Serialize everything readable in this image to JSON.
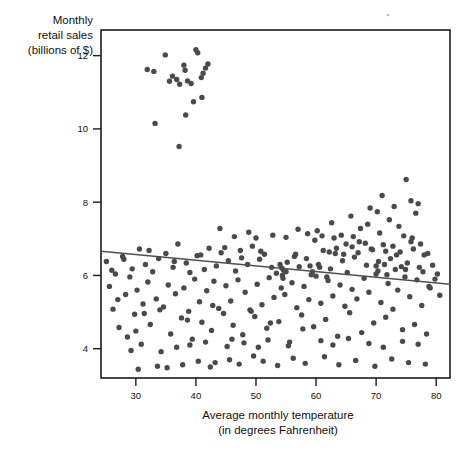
{
  "chart_data": {
    "type": "scatter",
    "title": "",
    "ylabel": "Monthly retail sales (billions of $)",
    "ylabel_line1": "Monthly",
    "ylabel_line2": "retail sales",
    "ylabel_line3": "(billions of $)",
    "xlabel": "Average monthly temperature (in degrees Fahrenheit)",
    "xlabel_line1": "Average monthly temperature",
    "xlabel_line2": "(in degrees Fahrenheit)",
    "xlim": [
      24.2,
      82.3
    ],
    "ylim": [
      3.2,
      12.7
    ],
    "xticks": [
      30,
      40,
      50,
      60,
      70,
      80
    ],
    "yticks": [
      4,
      6,
      8,
      10,
      12
    ],
    "xtick_labels": [
      "30",
      "40",
      "50",
      "60",
      "70",
      "80"
    ],
    "ytick_labels": [
      "4",
      "6",
      "8",
      "10",
      "12"
    ],
    "grid": false,
    "legend": false,
    "legend_position": "none",
    "marker_color": "#4a4a4a",
    "marker_size_px": 5.4,
    "trendline": {
      "type": "linear-regression",
      "color": "#4f4f4f",
      "x_start": 24.2,
      "y_start": 6.66,
      "x_end": 82.3,
      "y_end": 5.76,
      "slope": -0.0155,
      "intercept": 7.035
    },
    "points": [
      [
        29.2,
        3.95
      ],
      [
        31.9,
        11.62
      ],
      [
        33.0,
        11.57
      ],
      [
        34.9,
        12.02
      ],
      [
        35.6,
        11.3
      ],
      [
        36.1,
        11.44
      ],
      [
        36.8,
        11.35
      ],
      [
        37.3,
        11.22
      ],
      [
        38.0,
        11.74
      ],
      [
        38.2,
        11.6
      ],
      [
        38.6,
        11.31
      ],
      [
        39.2,
        11.24
      ],
      [
        40.0,
        12.16
      ],
      [
        40.3,
        12.08
      ],
      [
        40.9,
        11.4
      ],
      [
        41.2,
        11.52
      ],
      [
        41.6,
        11.66
      ],
      [
        42.0,
        11.77
      ],
      [
        39.6,
        10.74
      ],
      [
        41.0,
        10.86
      ],
      [
        33.2,
        10.15
      ],
      [
        38.3,
        10.38
      ],
      [
        37.2,
        9.52
      ],
      [
        25.1,
        6.38
      ],
      [
        25.6,
        5.7
      ],
      [
        26.2,
        5.08
      ],
      [
        26.6,
        6.04
      ],
      [
        27.2,
        4.58
      ],
      [
        27.8,
        6.52
      ],
      [
        28.3,
        5.48
      ],
      [
        28.6,
        4.32
      ],
      [
        29.0,
        5.96
      ],
      [
        29.4,
        6.18
      ],
      [
        29.8,
        4.94
      ],
      [
        30.2,
        5.6
      ],
      [
        30.6,
        6.72
      ],
      [
        30.9,
        4.12
      ],
      [
        31.2,
        5.22
      ],
      [
        31.6,
        6.3
      ],
      [
        32.0,
        5.82
      ],
      [
        32.4,
        4.66
      ],
      [
        32.8,
        6.1
      ],
      [
        33.4,
        5.36
      ],
      [
        33.8,
        6.46
      ],
      [
        34.2,
        3.92
      ],
      [
        34.6,
        5.14
      ],
      [
        35.0,
        6.6
      ],
      [
        35.4,
        5.74
      ],
      [
        35.8,
        4.4
      ],
      [
        36.2,
        6.22
      ],
      [
        36.6,
        5.5
      ],
      [
        37.0,
        6.86
      ],
      [
        37.6,
        4.84
      ],
      [
        38.0,
        5.66
      ],
      [
        38.4,
        6.34
      ],
      [
        38.8,
        5.02
      ],
      [
        39.0,
        6.08
      ],
      [
        39.4,
        4.26
      ],
      [
        39.8,
        5.9
      ],
      [
        40.2,
        6.54
      ],
      [
        40.6,
        5.28
      ],
      [
        41.0,
        4.72
      ],
      [
        41.4,
        6.16
      ],
      [
        41.8,
        5.58
      ],
      [
        42.2,
        6.74
      ],
      [
        42.6,
        4.5
      ],
      [
        43.0,
        5.84
      ],
      [
        43.4,
        6.26
      ],
      [
        43.8,
        5.1
      ],
      [
        44.2,
        6.62
      ],
      [
        44.6,
        4.96
      ],
      [
        45.0,
        5.72
      ],
      [
        45.4,
        6.4
      ],
      [
        45.8,
        5.3
      ],
      [
        46.2,
        4.64
      ],
      [
        46.6,
        6.12
      ],
      [
        47.0,
        5.88
      ],
      [
        47.4,
        6.68
      ],
      [
        47.8,
        4.38
      ],
      [
        48.2,
        5.54
      ],
      [
        48.6,
        6.3
      ],
      [
        49.0,
        5.06
      ],
      [
        49.4,
        6.8
      ],
      [
        49.8,
        4.88
      ],
      [
        50.2,
        5.76
      ],
      [
        50.6,
        6.44
      ],
      [
        51.0,
        5.2
      ],
      [
        51.4,
        6.58
      ],
      [
        51.8,
        4.56
      ],
      [
        52.2,
        5.94
      ],
      [
        52.6,
        6.22
      ],
      [
        53.0,
        5.4
      ],
      [
        53.4,
        6.06
      ],
      [
        53.8,
        4.74
      ],
      [
        54.2,
        5.66
      ],
      [
        54.4,
        6.0
      ],
      [
        54.6,
        6.14
      ],
      [
        54.8,
        5.48
      ],
      [
        55.2,
        6.36
      ],
      [
        55.6,
        4.18
      ],
      [
        56.0,
        5.8
      ],
      [
        56.4,
        6.52
      ],
      [
        56.8,
        5.12
      ],
      [
        57.2,
        6.24
      ],
      [
        57.6,
        4.92
      ],
      [
        58.0,
        5.7
      ],
      [
        58.4,
        6.46
      ],
      [
        58.8,
        5.34
      ],
      [
        59.2,
        6.02
      ],
      [
        59.6,
        4.6
      ],
      [
        60.0,
        5.98
      ],
      [
        60.4,
        6.3
      ],
      [
        60.8,
        5.24
      ],
      [
        61.2,
        6.68
      ],
      [
        61.6,
        4.8
      ],
      [
        62.0,
        5.86
      ],
      [
        62.4,
        6.18
      ],
      [
        62.8,
        5.44
      ],
      [
        63.2,
        6.6
      ],
      [
        63.6,
        4.34
      ],
      [
        64.0,
        5.74
      ],
      [
        64.4,
        6.4
      ],
      [
        64.8,
        5.16
      ],
      [
        65.2,
        6.08
      ],
      [
        65.6,
        4.98
      ],
      [
        66.0,
        5.62
      ],
      [
        66.4,
        6.5
      ],
      [
        66.8,
        5.36
      ],
      [
        67.2,
        6.92
      ],
      [
        67.6,
        4.44
      ],
      [
        68.0,
        5.92
      ],
      [
        68.4,
        6.28
      ],
      [
        68.8,
        5.54
      ],
      [
        69.2,
        6.72
      ],
      [
        69.6,
        4.7
      ],
      [
        70.0,
        6.04
      ],
      [
        70.4,
        6.38
      ],
      [
        70.8,
        5.26
      ],
      [
        71.2,
        6.84
      ],
      [
        71.6,
        4.86
      ],
      [
        72.0,
        5.78
      ],
      [
        72.4,
        6.46
      ],
      [
        72.8,
        5.08
      ],
      [
        73.2,
        6.16
      ],
      [
        73.6,
        5.6
      ],
      [
        74.0,
        6.64
      ],
      [
        74.4,
        4.52
      ],
      [
        74.8,
        5.96
      ],
      [
        75.2,
        6.34
      ],
      [
        75.6,
        5.42
      ],
      [
        76.0,
        7.02
      ],
      [
        76.4,
        4.66
      ],
      [
        76.8,
        5.88
      ],
      [
        77.2,
        6.22
      ],
      [
        77.6,
        5.18
      ],
      [
        78.0,
        6.56
      ],
      [
        78.4,
        4.4
      ],
      [
        78.8,
        5.7
      ],
      [
        60.2,
        7.22
      ],
      [
        62.6,
        7.44
      ],
      [
        64.2,
        7.1
      ],
      [
        65.8,
        7.62
      ],
      [
        67.4,
        7.28
      ],
      [
        69.0,
        7.84
      ],
      [
        70.6,
        7.16
      ],
      [
        72.2,
        7.52
      ],
      [
        73.8,
        7.34
      ],
      [
        75.0,
        8.62
      ],
      [
        75.8,
        8.04
      ],
      [
        76.6,
        7.7
      ],
      [
        77.0,
        7.96
      ],
      [
        71.0,
        8.18
      ],
      [
        74.6,
        7.08
      ],
      [
        66.2,
        7.06
      ],
      [
        68.6,
        7.4
      ],
      [
        63.0,
        7.02
      ],
      [
        70.2,
        7.74
      ],
      [
        73.0,
        7.88
      ],
      [
        44.0,
        7.28
      ],
      [
        46.4,
        7.06
      ],
      [
        48.8,
        7.18
      ],
      [
        50.0,
        7.02
      ],
      [
        52.8,
        7.1
      ],
      [
        55.0,
        7.04
      ],
      [
        57.0,
        7.26
      ],
      [
        58.6,
        7.14
      ],
      [
        59.8,
        6.96
      ],
      [
        61.0,
        7.08
      ],
      [
        43.2,
        3.62
      ],
      [
        45.6,
        3.7
      ],
      [
        47.2,
        3.58
      ],
      [
        49.6,
        3.8
      ],
      [
        51.2,
        3.66
      ],
      [
        53.6,
        3.54
      ],
      [
        56.2,
        3.74
      ],
      [
        58.2,
        3.6
      ],
      [
        61.4,
        3.78
      ],
      [
        63.8,
        3.56
      ],
      [
        66.6,
        3.68
      ],
      [
        69.8,
        3.52
      ],
      [
        72.6,
        3.72
      ],
      [
        75.4,
        3.62
      ],
      [
        78.2,
        3.58
      ],
      [
        35.2,
        3.48
      ],
      [
        37.8,
        3.56
      ],
      [
        40.4,
        3.66
      ],
      [
        42.4,
        3.5
      ],
      [
        54.0,
        6.3
      ],
      [
        54.3,
        6.2
      ],
      [
        54.5,
        5.92
      ],
      [
        55.0,
        6.1
      ],
      [
        59.0,
        6.26
      ],
      [
        59.4,
        6.1
      ],
      [
        60.6,
        6.22
      ],
      [
        61.8,
        5.96
      ],
      [
        70.0,
        6.26
      ],
      [
        70.3,
        6.12
      ],
      [
        71.4,
        6.3
      ],
      [
        71.8,
        6.02
      ],
      [
        74.2,
        6.24
      ],
      [
        74.9,
        6.16
      ],
      [
        77.8,
        6.1
      ],
      [
        79.0,
        5.66
      ],
      [
        79.4,
        6.28
      ],
      [
        79.8,
        5.9
      ],
      [
        80.2,
        6.04
      ],
      [
        80.6,
        5.46
      ],
      [
        66.0,
        6.78
      ],
      [
        67.0,
        6.62
      ],
      [
        68.2,
        6.88
      ],
      [
        69.4,
        6.7
      ],
      [
        63.4,
        6.74
      ],
      [
        64.6,
        6.58
      ],
      [
        65.0,
        6.86
      ],
      [
        62.2,
        6.64
      ],
      [
        71.6,
        6.66
      ],
      [
        72.8,
        6.8
      ],
      [
        73.4,
        6.56
      ],
      [
        76.2,
        6.72
      ],
      [
        77.4,
        6.86
      ],
      [
        78.6,
        6.6
      ],
      [
        75.8,
        6.92
      ],
      [
        26.0,
        6.14
      ],
      [
        27.0,
        5.34
      ],
      [
        28.0,
        6.44
      ],
      [
        30.0,
        4.48
      ],
      [
        32.2,
        6.68
      ],
      [
        34.0,
        5.06
      ],
      [
        36.4,
        6.38
      ],
      [
        38.6,
        4.78
      ],
      [
        40.8,
        6.56
      ],
      [
        42.8,
        5.18
      ],
      [
        44.8,
        6.76
      ],
      [
        46.0,
        4.26
      ],
      [
        47.6,
        6.48
      ],
      [
        49.2,
        5.02
      ],
      [
        50.8,
        6.66
      ],
      [
        52.4,
        4.7
      ],
      [
        56.6,
        6.58
      ],
      [
        57.8,
        4.54
      ],
      [
        30.4,
        3.44
      ],
      [
        33.6,
        3.52
      ],
      [
        45.2,
        4.06
      ],
      [
        48.0,
        4.16
      ],
      [
        50.4,
        4.04
      ],
      [
        52.0,
        4.24
      ],
      [
        55.4,
        4.08
      ],
      [
        60.8,
        4.22
      ],
      [
        62.8,
        4.1
      ],
      [
        65.4,
        4.28
      ],
      [
        68.8,
        4.14
      ],
      [
        71.2,
        4.04
      ],
      [
        74.4,
        4.2
      ],
      [
        77.0,
        4.12
      ],
      [
        41.6,
        4.18
      ],
      [
        39.0,
        4.1
      ],
      [
        36.8,
        4.04
      ],
      [
        31.4,
        4.96
      ]
    ]
  },
  "artifacts": {
    "speck_x": 388,
    "speck_y": 15
  }
}
